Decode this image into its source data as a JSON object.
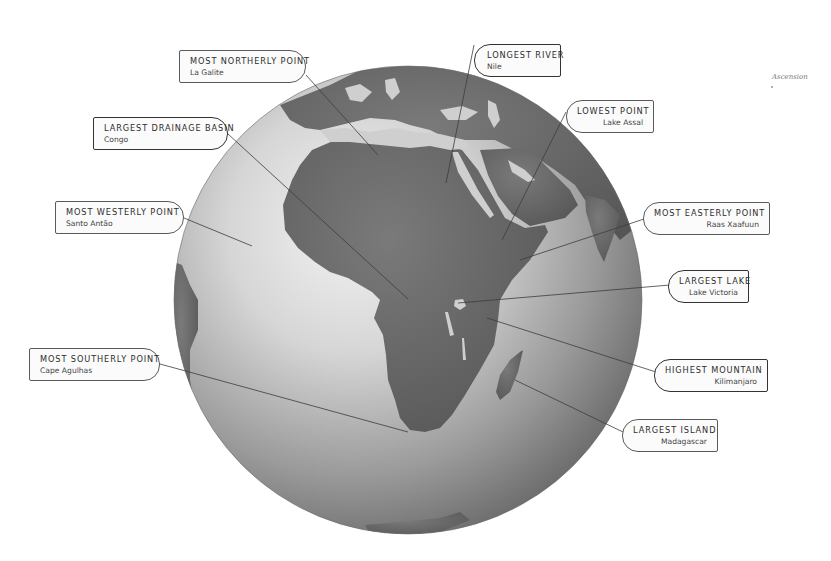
{
  "globe": {
    "center": [
      408,
      300
    ],
    "radius": 234,
    "ocean_light": "#e9e9e9",
    "ocean_dark": "#6a6a6a",
    "land": "#6e6e6e"
  },
  "side_annotation": {
    "text": "Ascension"
  },
  "callouts": [
    {
      "id": "most-northerly",
      "title": "MOST NORTHERLY POINT",
      "value": "La Galite"
    },
    {
      "id": "longest-river",
      "title": "LONGEST RIVER",
      "value": "Nile"
    },
    {
      "id": "lowest-point",
      "title": "LOWEST POINT",
      "value": "Lake Assal"
    },
    {
      "id": "largest-drainage-basin",
      "title": "LARGEST DRAINAGE BASIN",
      "value": "Congo"
    },
    {
      "id": "most-westerly",
      "title": "MOST WESTERLY POINT",
      "value": "Santo Antão"
    },
    {
      "id": "most-easterly",
      "title": "MOST EASTERLY POINT",
      "value": "Raas Xaafuun"
    },
    {
      "id": "largest-lake",
      "title": "LARGEST LAKE",
      "value": "Lake Victoria"
    },
    {
      "id": "most-southerly",
      "title": "MOST SOUTHERLY POINT",
      "value": "Cape Agulhas"
    },
    {
      "id": "highest-mountain",
      "title": "HIGHEST MOUNTAIN",
      "value": "Kilimanjaro"
    },
    {
      "id": "largest-island",
      "title": "LARGEST ISLAND",
      "value": "Madagascar"
    }
  ]
}
